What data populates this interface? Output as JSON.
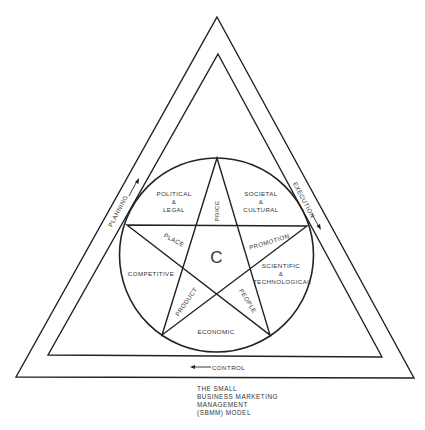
{
  "diagram": {
    "title_lines": [
      "THE SMALL",
      "BUSINESS MARKETING",
      "MANAGEMENT",
      "(SBMM) MODEL"
    ],
    "center_label": "C",
    "flow_labels": {
      "planning": "PLANNING",
      "execution": "EXECUTION",
      "control": "CONTROL"
    },
    "environment_segments": {
      "political_legal": [
        "POLITICAL",
        "&",
        "LEGAL"
      ],
      "societal_cultural": [
        "SOCIETAL",
        "&",
        "CULTURAL"
      ],
      "competitive": [
        "COMPETITIVE"
      ],
      "scientific_technological": [
        "SCIENTIFIC",
        "&",
        "TECHNOLOGICAL"
      ],
      "economic": [
        "ECONOMIC"
      ]
    },
    "marketing_mix": {
      "price": "PRICE",
      "place": "PLACE",
      "promotion": "PROMOTION",
      "product": "PRODUCT",
      "people": "PEOPLE"
    },
    "colors": {
      "stroke": "#222222",
      "text": "#333333",
      "background": "#ffffff"
    }
  }
}
